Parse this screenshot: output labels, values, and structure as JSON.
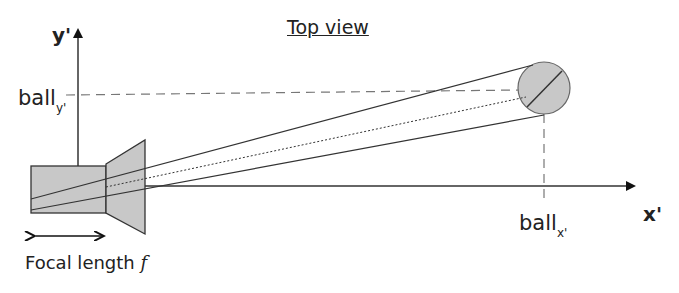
{
  "diagram": {
    "title": "Top view",
    "axes": {
      "x_label": "x'",
      "y_label": "y'"
    },
    "labels": {
      "ball_y_main": "ball",
      "ball_y_sub": "y'",
      "ball_x_main": "ball",
      "ball_x_sub": "x'",
      "focal_text": "Focal length ",
      "focal_symbol": "f"
    },
    "colors": {
      "line": "#333333",
      "fill": "#c8c8c8",
      "dashed": "#777777"
    }
  }
}
